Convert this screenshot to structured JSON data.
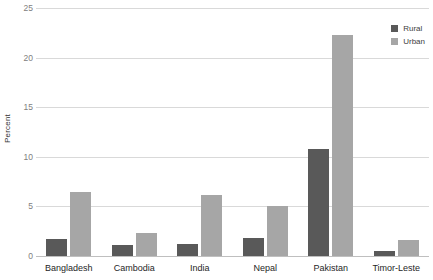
{
  "chart_data": {
    "type": "bar",
    "title": "",
    "subtitle": "",
    "xlabel": "",
    "ylabel": "Percent",
    "ylim": [
      0,
      25
    ],
    "yticks": [
      0,
      5,
      10,
      15,
      20,
      25
    ],
    "ytick_labels": [
      "0",
      "5",
      "10",
      "15",
      "20",
      "25"
    ],
    "grid": true,
    "legend_position": "top-right",
    "categories": [
      "Bangladesh",
      "Cambodia",
      "India",
      "Nepal",
      "Pakistan",
      "Timor-Leste"
    ],
    "series": [
      {
        "name": "Rural",
        "color": "#595959",
        "values": [
          1.7,
          1.1,
          1.2,
          1.8,
          10.8,
          0.5
        ]
      },
      {
        "name": "Urban",
        "color": "#a6a6a6",
        "values": [
          6.5,
          2.3,
          6.2,
          5.0,
          22.3,
          1.6
        ]
      }
    ]
  },
  "legend": {
    "items": [
      {
        "label": "Rural"
      },
      {
        "label": "Urban"
      }
    ]
  },
  "colors": {
    "rural": "#595959",
    "urban": "#a6a6a6",
    "gridline": "#d9d9d9",
    "baseline": "#bfbfbf",
    "tick_text": "#808080",
    "axis_text": "#262626",
    "background": "#ffffff"
  }
}
